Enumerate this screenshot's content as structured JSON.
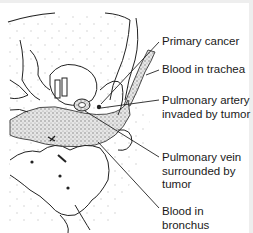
{
  "figure": {
    "labels": [
      {
        "id": "primary-cancer",
        "text": "Primary cancer"
      },
      {
        "id": "blood-in-trachea",
        "text": "Blood in trachea"
      },
      {
        "id": "pulmonary-artery",
        "text": "Pulmonary artery\ninvaded by tumor"
      },
      {
        "id": "pulmonary-vein",
        "text": "Pulmonary vein\nsurrounded by\ntumor"
      },
      {
        "id": "blood-in-bronchus",
        "text": "Blood in bronchus"
      }
    ],
    "colors": {
      "line": "#222222",
      "stipple": "#9a9a9a",
      "frame": "#eeeeee"
    }
  }
}
